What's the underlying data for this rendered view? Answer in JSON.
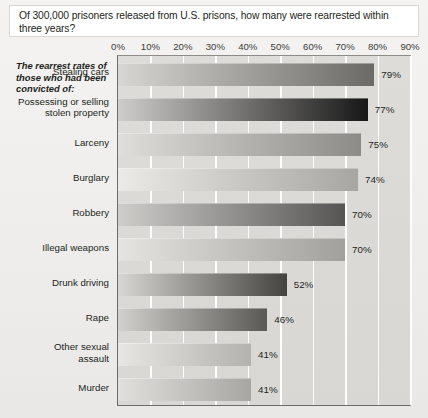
{
  "title": "Of 300,000 prisoners released from U.S. prisons, how many were rearrested within three years?",
  "subtitle": "The rearrest rates of those who had been convicted of:",
  "chart_data": {
    "type": "bar",
    "orientation": "horizontal",
    "title": "Of 300,000 prisoners released from U.S. prisons, how many were rearrested within three years?",
    "subtitle": "The rearrest rates of those who had been convicted of:",
    "xlabel": "",
    "ylabel": "",
    "xlim": [
      0,
      90
    ],
    "xticks": [
      "0%",
      "10%",
      "20%",
      "30%",
      "40%",
      "50%",
      "60%",
      "70%",
      "80%",
      "90%"
    ],
    "xtick_values": [
      0,
      10,
      20,
      30,
      40,
      50,
      60,
      70,
      80,
      90
    ],
    "grid": true,
    "legend": "none",
    "categories": [
      "Stealing cars",
      "Possessing or selling stolen property",
      "Larceny",
      "Burglary",
      "Robbery",
      "Illegal weapons",
      "Drunk driving",
      "Rape",
      "Other sexual assault",
      "Murder"
    ],
    "values": [
      79,
      77,
      75,
      74,
      70,
      70,
      52,
      46,
      41,
      41
    ],
    "value_labels": [
      "79%",
      "77%",
      "75%",
      "74%",
      "70%",
      "70%",
      "52%",
      "46%",
      "41%",
      "41%"
    ],
    "bar_colors_start": [
      "#d8d6d3",
      "#cfcdca",
      "#e0dedb",
      "#eceae7",
      "#cfcdca",
      "#e6e4e1",
      "#d8d6d3",
      "#d2d0cd",
      "#e8e6e3",
      "#e2e0dd"
    ],
    "bar_colors_end": [
      "#6b6a67",
      "#171717",
      "#8d8b88",
      "#a8a6a3",
      "#565553",
      "#a2a09d",
      "#44433f",
      "#5b5956",
      "#b4b2af",
      "#a8a6a3"
    ]
  },
  "category_label_lines": [
    [
      "Stealing cars"
    ],
    [
      "Possessing or selling",
      "stolen property"
    ],
    [
      "Larceny"
    ],
    [
      "Burglary"
    ],
    [
      "Robbery"
    ],
    [
      "Illegal weapons"
    ],
    [
      "Drunk driving"
    ],
    [
      "Rape"
    ],
    [
      "Other sexual",
      "assault"
    ],
    [
      "Murder"
    ]
  ],
  "colors": {
    "page_background": "#f1efed",
    "plot_background": "#dddbd8",
    "gridline": "#fdfdfc",
    "axis": "#6e6c69",
    "text": "#231f20",
    "title_box_background": "#ffffff"
  }
}
